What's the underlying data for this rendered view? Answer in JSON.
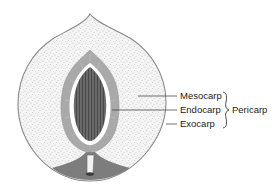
{
  "diagram": {
    "labels": {
      "mesocarp": "Mesocarp",
      "endocarp": "Endocarp",
      "exocarp": "Exocarp",
      "group": "Pericarp"
    },
    "colors": {
      "background": "#ffffff",
      "outline": "#8a8a8a",
      "flesh": "#f2f2f2",
      "stipple": "#9a9a9a",
      "endocarp": "#a9a9a9",
      "seed": "#5a5a5a",
      "stem_region": "#7d7d7d",
      "leader_line": "#333333"
    }
  }
}
